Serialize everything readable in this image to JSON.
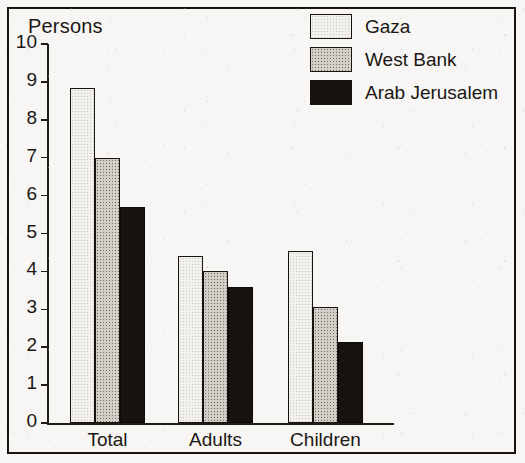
{
  "chart_data": {
    "type": "bar",
    "title": "",
    "ylabel": "Persons",
    "xlabel": "",
    "ylim": [
      0,
      10
    ],
    "yticks": [
      0,
      1,
      2,
      3,
      4,
      5,
      6,
      7,
      8,
      9,
      10
    ],
    "ytick_labels": [
      "0",
      "1",
      "2",
      "3",
      "4",
      "5",
      "6",
      "7",
      "8",
      "9",
      "10"
    ],
    "grid": false,
    "legend_position": "top-right",
    "categories": [
      "Total",
      "Adults",
      "Children"
    ],
    "series": [
      {
        "name": "Gaza",
        "values": [
          8.85,
          4.4,
          4.55
        ],
        "color": "#f2f1ee",
        "pattern": "light-dotted"
      },
      {
        "name": "West Bank",
        "values": [
          7.0,
          4.0,
          3.05
        ],
        "color": "#d2cfc9",
        "pattern": "medium-dotted"
      },
      {
        "name": "Arab Jerusalem",
        "values": [
          5.7,
          3.6,
          2.15
        ],
        "color": "#16130e",
        "pattern": "solid-black"
      }
    ]
  },
  "legend": {
    "items": [
      {
        "label": "Gaza"
      },
      {
        "label": "West Bank"
      },
      {
        "label": "Arab Jerusalem"
      }
    ]
  },
  "axis": {
    "y_title": "Persons"
  }
}
